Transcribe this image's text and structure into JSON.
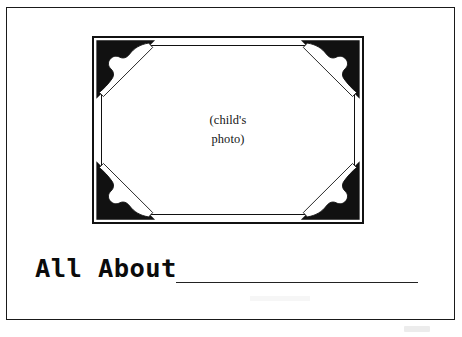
{
  "page": {
    "width": 462,
    "height": 337,
    "background_color": "#ffffff",
    "border_color": "#1a1a1a"
  },
  "photo_frame": {
    "name": "decorative-photo-frame",
    "frame_color": "#111111",
    "fill_color": "#ffffff",
    "corner_ornament_color": "#111111",
    "caption_lines": [
      "(child's",
      "photo)"
    ]
  },
  "title": {
    "label": "All About",
    "color": "#0b0b0b"
  },
  "name_blank": {
    "value": "",
    "placeholder": "",
    "line_color": "#222222"
  }
}
